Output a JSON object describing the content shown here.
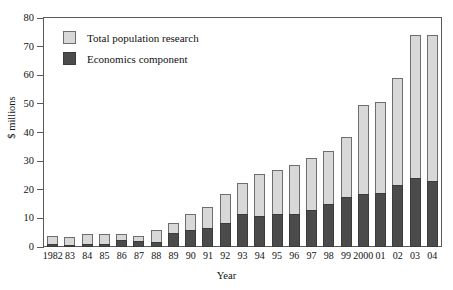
{
  "chart_data": {
    "type": "bar",
    "subtype": "stacked",
    "title": "",
    "xlabel": "Year",
    "ylabel": "$ millions",
    "ylim": [
      0,
      80
    ],
    "yticks": [
      0,
      10,
      20,
      30,
      40,
      50,
      60,
      70,
      80
    ],
    "grid": false,
    "legend_position": "top-left",
    "categories": [
      "1982",
      "83",
      "84",
      "85",
      "86",
      "87",
      "88",
      "89",
      "90",
      "91",
      "92",
      "93",
      "94",
      "95",
      "96",
      "97",
      "98",
      "99",
      "2000",
      "01",
      "02",
      "03",
      "04"
    ],
    "series": [
      {
        "name": "Total population research",
        "color": "#d8d8d8",
        "values": [
          4.0,
          3.5,
          4.5,
          4.5,
          4.5,
          4.0,
          6.0,
          8.5,
          11.5,
          14.0,
          18.5,
          22.5,
          25.5,
          27.0,
          28.5,
          31.0,
          33.5,
          38.5,
          49.5,
          50.5,
          59.0,
          74.0,
          74.0
        ]
      },
      {
        "name": "Economics component",
        "color": "#4b4b4b",
        "values": [
          1.0,
          0.6,
          1.0,
          1.0,
          2.5,
          2.0,
          1.8,
          5.0,
          6.0,
          6.5,
          8.5,
          11.5,
          11.0,
          11.5,
          11.5,
          13.0,
          15.0,
          17.5,
          18.5,
          19.0,
          21.5,
          24.0,
          23.0
        ]
      }
    ]
  },
  "legend": {
    "items": [
      {
        "label": "Total population research",
        "swatch": "total"
      },
      {
        "label": "Economics component",
        "swatch": "econ"
      }
    ]
  },
  "axes": {
    "y_title": "$ millions",
    "x_title": "Year"
  }
}
